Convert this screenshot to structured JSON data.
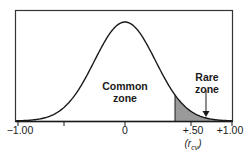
{
  "chart_data": {
    "type": "area",
    "title": "",
    "xlabel": "",
    "ylabel": "",
    "x_ticks": [
      {
        "value": -1.0,
        "label": "−1.00"
      },
      {
        "value": -0.5,
        "label": ""
      },
      {
        "value": 0,
        "label": "0"
      },
      {
        "value": 0.5,
        "label": "+.50"
      },
      {
        "value": 1.0,
        "label": "+1.00"
      }
    ],
    "critical_value_label": "(r",
    "critical_value_subscript": "cv",
    "critical_value_suffix": ")",
    "annotations": [
      {
        "text": "Common zone",
        "line1": "Common",
        "line2": "zone"
      },
      {
        "text": "Rare zone",
        "line1": "Rare",
        "line2": "zone",
        "arrow": true
      }
    ],
    "shaded_region": {
      "from": 0.42,
      "to": 1.0,
      "color": "#9a9a9a"
    },
    "curve": {
      "mean": 0,
      "shape": "normal"
    },
    "grid": false,
    "legend": null
  },
  "labels": {
    "tick_neg1": "−1.00",
    "tick_0": "0",
    "tick_pos50": "+.50",
    "tick_pos1": "+1.00",
    "common_line1": "Common",
    "common_line2": "zone",
    "rare_line1": "Rare",
    "rare_line2": "zone",
    "rcv_open": "(r",
    "rcv_sub": "cv",
    "rcv_close": ")"
  },
  "colors": {
    "line": "#1a1a1a",
    "shade": "#9a9a9a",
    "frame": "#333333"
  }
}
